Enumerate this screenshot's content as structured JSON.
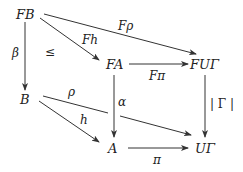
{
  "diagram": {
    "type": "commutative-diagram",
    "nodes": [
      {
        "id": "FB",
        "label": "FB"
      },
      {
        "id": "FA",
        "label": "FA"
      },
      {
        "id": "FUG",
        "label": "FUΓ"
      },
      {
        "id": "B",
        "label": "B"
      },
      {
        "id": "A",
        "label": "A"
      },
      {
        "id": "UG",
        "label": "UΓ"
      }
    ],
    "edges": [
      {
        "id": "Frho",
        "from": "FB",
        "to": "FUG",
        "label": "Fρ"
      },
      {
        "id": "Fh",
        "from": "FB",
        "to": "FA",
        "label": "Fh"
      },
      {
        "id": "beta",
        "from": "FB",
        "to": "B",
        "label": "β"
      },
      {
        "id": "Fpi",
        "from": "FA",
        "to": "FUG",
        "label": "Fπ"
      },
      {
        "id": "alpha",
        "from": "FA",
        "to": "A",
        "label": "α"
      },
      {
        "id": "absGamma",
        "from": "FUG",
        "to": "UG",
        "label": "| Γ |"
      },
      {
        "id": "rho",
        "from": "B",
        "to": "UG",
        "label": "ρ"
      },
      {
        "id": "h",
        "from": "B",
        "to": "A",
        "label": "h"
      },
      {
        "id": "pi",
        "from": "A",
        "to": "UG",
        "label": "π"
      }
    ],
    "annotations": [
      {
        "id": "leq",
        "label": "≤"
      }
    ]
  }
}
